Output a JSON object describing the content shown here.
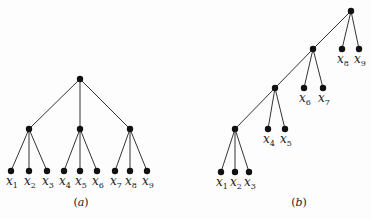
{
  "diagram": {
    "trees": [
      {
        "id": "a",
        "caption": "(a)",
        "caption_letter": "a",
        "caption_pos": [
          81,
          206
        ],
        "nodes": [
          {
            "id": "r",
            "x": 80,
            "y": 79
          },
          {
            "id": "n1",
            "x": 29,
            "y": 129
          },
          {
            "id": "n2",
            "x": 80,
            "y": 129
          },
          {
            "id": "n3",
            "x": 130,
            "y": 129
          },
          {
            "id": "x1",
            "x": 11,
            "y": 171,
            "label": "x",
            "sub": "1"
          },
          {
            "id": "x2",
            "x": 29,
            "y": 171,
            "label": "x",
            "sub": "2"
          },
          {
            "id": "x3",
            "x": 47,
            "y": 171,
            "label": "x",
            "sub": "3"
          },
          {
            "id": "x4",
            "x": 64,
            "y": 171,
            "label": "x",
            "sub": "4"
          },
          {
            "id": "x5",
            "x": 80,
            "y": 171,
            "label": "x",
            "sub": "5"
          },
          {
            "id": "x6",
            "x": 97,
            "y": 171,
            "label": "x",
            "sub": "6"
          },
          {
            "id": "x7",
            "x": 115,
            "y": 171,
            "label": "x",
            "sub": "7"
          },
          {
            "id": "x8",
            "x": 130,
            "y": 171,
            "label": "x",
            "sub": "8"
          },
          {
            "id": "x9",
            "x": 147,
            "y": 171,
            "label": "x",
            "sub": "9"
          }
        ],
        "edges": [
          [
            "r",
            "n1"
          ],
          [
            "r",
            "n2"
          ],
          [
            "r",
            "n3"
          ],
          [
            "n1",
            "x1"
          ],
          [
            "n1",
            "x2"
          ],
          [
            "n1",
            "x3"
          ],
          [
            "n2",
            "x4"
          ],
          [
            "n2",
            "x5"
          ],
          [
            "n2",
            "x6"
          ],
          [
            "n3",
            "x7"
          ],
          [
            "n3",
            "x8"
          ],
          [
            "n3",
            "x9"
          ]
        ]
      },
      {
        "id": "b",
        "caption": "(b)",
        "caption_letter": "b",
        "caption_pos": [
          299,
          206
        ],
        "nodes": [
          {
            "id": "r",
            "x": 351,
            "y": 11
          },
          {
            "id": "m1",
            "x": 313,
            "y": 49
          },
          {
            "id": "m2",
            "x": 275,
            "y": 88
          },
          {
            "id": "m3",
            "x": 235,
            "y": 129
          },
          {
            "id": "x8",
            "x": 342,
            "y": 49,
            "label": "x",
            "sub": "8"
          },
          {
            "id": "x9",
            "x": 359,
            "y": 49,
            "label": "x",
            "sub": "9"
          },
          {
            "id": "x6",
            "x": 304,
            "y": 88,
            "label": "x",
            "sub": "6"
          },
          {
            "id": "x7",
            "x": 323,
            "y": 88,
            "label": "x",
            "sub": "7"
          },
          {
            "id": "x4",
            "x": 268,
            "y": 129,
            "label": "x",
            "sub": "4"
          },
          {
            "id": "x5",
            "x": 285,
            "y": 129,
            "label": "x",
            "sub": "5"
          },
          {
            "id": "x1",
            "x": 221,
            "y": 172,
            "label": "x",
            "sub": "1"
          },
          {
            "id": "x2",
            "x": 235,
            "y": 172,
            "label": "x",
            "sub": "2"
          },
          {
            "id": "x3",
            "x": 249,
            "y": 172,
            "label": "x",
            "sub": "3"
          }
        ],
        "edges": [
          [
            "r",
            "m1"
          ],
          [
            "r",
            "x8"
          ],
          [
            "r",
            "x9"
          ],
          [
            "m1",
            "m2"
          ],
          [
            "m1",
            "x6"
          ],
          [
            "m1",
            "x7"
          ],
          [
            "m2",
            "m3"
          ],
          [
            "m2",
            "x4"
          ],
          [
            "m2",
            "x5"
          ],
          [
            "m3",
            "x1"
          ],
          [
            "m3",
            "x2"
          ],
          [
            "m3",
            "x3"
          ]
        ]
      }
    ],
    "style": {
      "edge_color": "#333333",
      "node_color": "#111111",
      "node_radius": 3.2,
      "text_color": "#222222"
    }
  }
}
